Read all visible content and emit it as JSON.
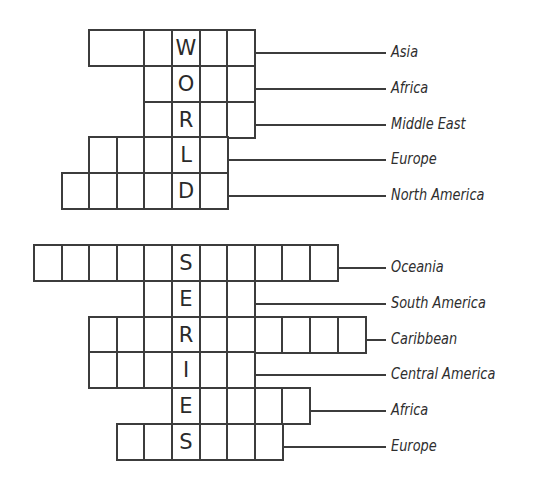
{
  "grid": {
    "origin_x": 33,
    "cell_width": 27.6,
    "row_height": 35.8,
    "line_end_x": 385,
    "label_x": 391,
    "line_color": "#3c3c3c"
  },
  "puzzles": [
    {
      "name": "world",
      "keyword": "WORLD",
      "top_y": 29,
      "key_column": 5,
      "rows": [
        {
          "clue": "Asia",
          "letter": "W",
          "start_col": 2,
          "end_col": 8,
          "merged_first": 2
        },
        {
          "clue": "Africa",
          "letter": "O",
          "start_col": 4,
          "end_col": 8
        },
        {
          "clue": "Middle East",
          "letter": "R",
          "start_col": 4,
          "end_col": 8
        },
        {
          "clue": "Europe",
          "letter": "L",
          "start_col": 2,
          "end_col": 7
        },
        {
          "clue": "North America",
          "letter": "D",
          "start_col": 1,
          "end_col": 7
        }
      ]
    },
    {
      "name": "series",
      "keyword": "SERIES",
      "top_y": 244,
      "key_column": 5,
      "rows": [
        {
          "clue": "Oceania",
          "letter": "S",
          "start_col": 0,
          "end_col": 11
        },
        {
          "clue": "South America",
          "letter": "E",
          "start_col": 4,
          "end_col": 8
        },
        {
          "clue": "Caribbean",
          "letter": "R",
          "start_col": 2,
          "end_col": 12
        },
        {
          "clue": "Central America",
          "letter": "I",
          "start_col": 2,
          "end_col": 8
        },
        {
          "clue": "Africa",
          "letter": "E",
          "start_col": 5,
          "end_col": 10
        },
        {
          "clue": "Europe",
          "letter": "S",
          "start_col": 3,
          "end_col": 9
        }
      ]
    }
  ]
}
